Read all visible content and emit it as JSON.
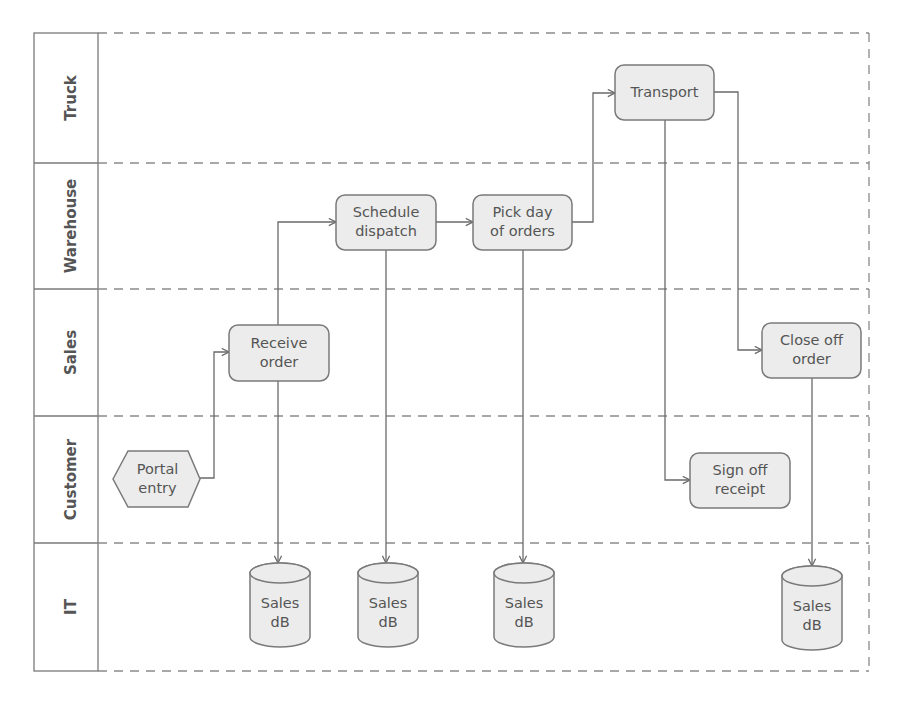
{
  "diagram": {
    "type": "swimlane-flowchart",
    "colors": {
      "node_fill": "#ececec",
      "node_stroke": "#7a7a7a",
      "text": "#555555",
      "line": "#6a6a6a"
    },
    "lanes": [
      {
        "id": "truck",
        "label": "Truck"
      },
      {
        "id": "warehouse",
        "label": "Warehouse"
      },
      {
        "id": "sales",
        "label": "Sales"
      },
      {
        "id": "customer",
        "label": "Customer"
      },
      {
        "id": "it",
        "label": "IT"
      }
    ],
    "nodes": [
      {
        "id": "portal_entry",
        "lane": "customer",
        "shape": "hexagon",
        "lines": [
          "Portal",
          "entry"
        ]
      },
      {
        "id": "receive_order",
        "lane": "sales",
        "shape": "rounded-rect",
        "lines": [
          "Receive",
          "order"
        ]
      },
      {
        "id": "schedule_dispatch",
        "lane": "warehouse",
        "shape": "rounded-rect",
        "lines": [
          "Schedule",
          "dispatch"
        ]
      },
      {
        "id": "pick_day",
        "lane": "warehouse",
        "shape": "rounded-rect",
        "lines": [
          "Pick day",
          "of orders"
        ]
      },
      {
        "id": "transport",
        "lane": "truck",
        "shape": "rounded-rect",
        "lines": [
          "Transport"
        ]
      },
      {
        "id": "close_off_order",
        "lane": "sales",
        "shape": "rounded-rect",
        "lines": [
          "Close off",
          "order"
        ]
      },
      {
        "id": "sign_off_receipt",
        "lane": "customer",
        "shape": "rounded-rect",
        "lines": [
          "Sign off",
          "receipt"
        ]
      },
      {
        "id": "sales_db_1",
        "lane": "it",
        "shape": "cylinder",
        "lines": [
          "Sales",
          "dB"
        ]
      },
      {
        "id": "sales_db_2",
        "lane": "it",
        "shape": "cylinder",
        "lines": [
          "Sales",
          "dB"
        ]
      },
      {
        "id": "sales_db_3",
        "lane": "it",
        "shape": "cylinder",
        "lines": [
          "Sales",
          "dB"
        ]
      },
      {
        "id": "sales_db_4",
        "lane": "it",
        "shape": "cylinder",
        "lines": [
          "Sales",
          "dB"
        ]
      }
    ],
    "edges": [
      {
        "from": "portal_entry",
        "to": "receive_order"
      },
      {
        "from": "receive_order",
        "to": "schedule_dispatch"
      },
      {
        "from": "receive_order",
        "to": "sales_db_1"
      },
      {
        "from": "schedule_dispatch",
        "to": "pick_day"
      },
      {
        "from": "schedule_dispatch",
        "to": "sales_db_2"
      },
      {
        "from": "pick_day",
        "to": "transport"
      },
      {
        "from": "pick_day",
        "to": "sales_db_3"
      },
      {
        "from": "transport",
        "to": "close_off_order"
      },
      {
        "from": "transport",
        "to": "sign_off_receipt"
      },
      {
        "from": "close_off_order",
        "to": "sales_db_4"
      }
    ]
  }
}
